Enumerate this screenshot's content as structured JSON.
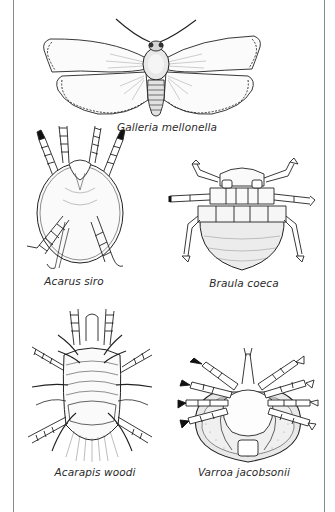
{
  "plate": {
    "specimens": [
      {
        "id": "galleria",
        "caption": "Galleria mellonella",
        "icon": "moth-icon"
      },
      {
        "id": "acarus",
        "caption": "Acarus siro",
        "icon": "mite-icon"
      },
      {
        "id": "braula",
        "caption": "Braula coeca",
        "icon": "bee-louse-icon"
      },
      {
        "id": "acarapis",
        "caption": "Acarapis woodi",
        "icon": "tracheal-mite-icon"
      },
      {
        "id": "varroa",
        "caption": "Varroa jacobsonii",
        "icon": "varroa-mite-icon"
      }
    ]
  },
  "colors": {
    "ink": "#222222",
    "frame": "#8a8a8a",
    "background": "#ffffff"
  }
}
